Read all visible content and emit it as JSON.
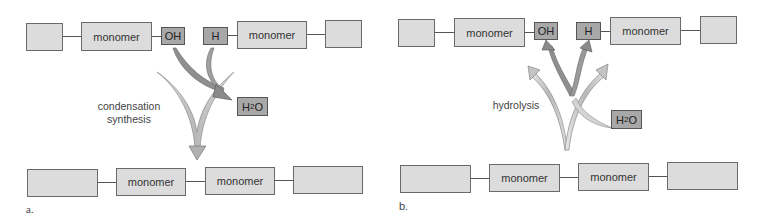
{
  "panels": [
    {
      "id": "a",
      "letter": "a.",
      "process_label_line1": "condensation",
      "process_label_line2": "synthesis",
      "top_row": {
        "monomer_left": "monomer",
        "group_left": "OH",
        "group_right": "H",
        "monomer_right": "monomer"
      },
      "water": {
        "prefix": "H",
        "subscript": "2",
        "suffix": "O"
      },
      "bottom_row": {
        "monomer_1": "monomer",
        "monomer_2": "monomer"
      }
    },
    {
      "id": "b",
      "letter": "b.",
      "process_label": "hydrolysis",
      "top_row": {
        "monomer_left": "monomer",
        "group_left": "OH",
        "group_right": "H",
        "monomer_right": "monomer"
      },
      "water": {
        "prefix": "H",
        "subscript": "2",
        "suffix": "O"
      },
      "bottom_row": {
        "monomer_1": "monomer",
        "monomer_2": "monomer"
      }
    }
  ],
  "colors": {
    "box_fill": "#dcdcdc",
    "group_fill": "#a8a8a8",
    "arrow_light": "#c8c8c8",
    "arrow_dark": "#8c8c8c"
  }
}
